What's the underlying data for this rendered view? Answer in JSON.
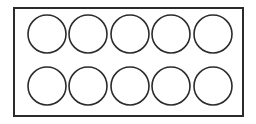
{
  "figure": {
    "name": "ten-circles-in-rectangle",
    "canvas": {
      "width": 256,
      "height": 124,
      "background_color": "#ffffff"
    },
    "frame": {
      "shape": "rectangle",
      "x": 14,
      "y": 8,
      "width": 229,
      "height": 108,
      "stroke_color": "#2b2b2b",
      "stroke_width": 2,
      "fill_color": "#ffffff"
    },
    "circles": {
      "count": 10,
      "rows": 2,
      "columns": 5,
      "radius": 19,
      "stroke_color": "#2b2b2b",
      "stroke_width": 1.6,
      "fill_color": "#ffffff",
      "row_centers_y": [
        34,
        86
      ],
      "column_centers_x": [
        47,
        88,
        130,
        171,
        213
      ],
      "items": [
        {
          "id": "circle-r1-c1",
          "row": 1,
          "column": 1,
          "cx": 47,
          "cy": 34,
          "r": 19
        },
        {
          "id": "circle-r1-c2",
          "row": 1,
          "column": 2,
          "cx": 88,
          "cy": 34,
          "r": 19
        },
        {
          "id": "circle-r1-c3",
          "row": 1,
          "column": 3,
          "cx": 130,
          "cy": 34,
          "r": 19
        },
        {
          "id": "circle-r1-c4",
          "row": 1,
          "column": 4,
          "cx": 171,
          "cy": 34,
          "r": 19
        },
        {
          "id": "circle-r1-c5",
          "row": 1,
          "column": 5,
          "cx": 213,
          "cy": 34,
          "r": 19
        },
        {
          "id": "circle-r2-c1",
          "row": 2,
          "column": 1,
          "cx": 47,
          "cy": 86,
          "r": 19
        },
        {
          "id": "circle-r2-c2",
          "row": 2,
          "column": 2,
          "cx": 88,
          "cy": 86,
          "r": 19
        },
        {
          "id": "circle-r2-c3",
          "row": 2,
          "column": 3,
          "cx": 130,
          "cy": 86,
          "r": 19
        },
        {
          "id": "circle-r2-c4",
          "row": 2,
          "column": 4,
          "cx": 171,
          "cy": 86,
          "r": 19
        },
        {
          "id": "circle-r2-c5",
          "row": 2,
          "column": 5,
          "cx": 213,
          "cy": 86,
          "r": 19
        }
      ]
    }
  }
}
